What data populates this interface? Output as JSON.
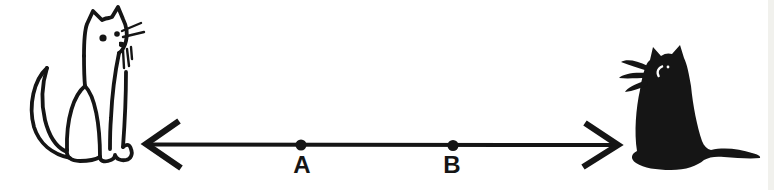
{
  "figure": {
    "colors": {
      "ink": "#151515",
      "background": "#ffffff",
      "scan_edge": "#ededе8"
    },
    "left_illustration": {
      "name": "white outline cat",
      "description": "hand-drawn sitting cat, line art, facing right, whiskers, curved tail"
    },
    "right_illustration": {
      "name": "black silhouette cat",
      "description": "hand-drawn sitting black cat, facing left, white crescent eye, whiskers, tail along ground"
    },
    "line": {
      "style": "double-headed arrow",
      "points": [
        {
          "label": "A"
        },
        {
          "label": "B"
        }
      ]
    }
  }
}
